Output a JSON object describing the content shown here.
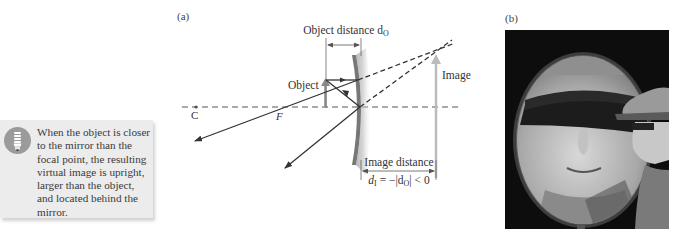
{
  "panels": {
    "a_label": "(a)",
    "b_label": "(b)"
  },
  "note": {
    "icon": "lightbulb-icon",
    "text": "When the object is closer to the mirror than the focal point, the resulting virtual image is upright, larger than the object, and located behind the mirror."
  },
  "diagram": {
    "object_distance_label": "Object distance d",
    "object_distance_sub": "O",
    "object_label": "Object",
    "image_label": "Image",
    "center_label": "C",
    "focal_label": "F",
    "image_distance_label": "Image distance",
    "image_distance_formula_d": "d",
    "image_distance_formula_sub": "I",
    "image_distance_formula_rest": " = −|d",
    "image_distance_formula_sub2": "O",
    "image_distance_formula_end": "| < 0"
  },
  "photo": {
    "description": "Man in cap and sunglasses looking into a concave mirror showing a magnified upright reflection of his face"
  }
}
